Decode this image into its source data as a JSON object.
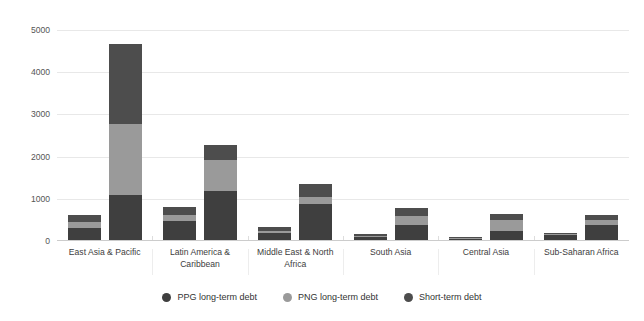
{
  "chart_data": {
    "type": "bar",
    "subtype": "grouped-stacked",
    "title": "",
    "xlabel": "",
    "ylabel": "",
    "ylim": [
      0,
      5000
    ],
    "yticks": [
      0,
      1000,
      2000,
      3000,
      4000,
      5000
    ],
    "ytick_labels": [
      "0",
      "1000",
      "2000",
      "3000",
      "4000",
      "5000"
    ],
    "grid": true,
    "grid_axis": "y",
    "legend_position": "bottom",
    "categories": [
      "East Asia & Pacific",
      "Latin America & Caribbean",
      "Middle East & North Africa",
      "South Asia",
      "Central Asia",
      "Sub-Saharan Africa"
    ],
    "bars_per_category": 2,
    "series": [
      {
        "name": "PPG long-term debt",
        "color": "#3f3f3f",
        "values": [
          [
            310,
            1080
          ],
          [
            470,
            1180
          ],
          [
            190,
            880
          ],
          [
            100,
            370
          ],
          [
            55,
            235
          ],
          [
            140,
            390
          ]
        ]
      },
      {
        "name": "PNG long-term debt",
        "color": "#9a9a9a",
        "values": [
          [
            130,
            1690
          ],
          [
            145,
            740
          ],
          [
            40,
            170
          ],
          [
            25,
            230
          ],
          [
            20,
            260
          ],
          [
            25,
            115
          ]
        ]
      },
      {
        "name": "Short-term debt",
        "color": "#4d4d4d",
        "values": [
          [
            170,
            1890
          ],
          [
            190,
            345
          ],
          [
            110,
            290
          ],
          [
            30,
            190
          ],
          [
            20,
            140
          ],
          [
            30,
            105
          ]
        ]
      }
    ],
    "legend": [
      {
        "label": "PPG long-term debt",
        "color": "#3f3f3f"
      },
      {
        "label": "PNG long-term debt",
        "color": "#9a9a9a"
      },
      {
        "label": "Short-term debt",
        "color": "#4d4d4d"
      }
    ]
  }
}
